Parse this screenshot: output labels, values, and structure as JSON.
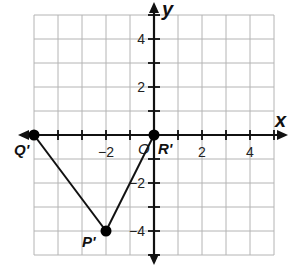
{
  "diagram": {
    "type": "coordinate-plane",
    "axes": {
      "x_label": "x",
      "y_label": "y",
      "origin_label": "O",
      "x_range": [
        -5,
        5
      ],
      "y_range": [
        -5,
        5
      ],
      "grid_step": 1,
      "x_tick_labels": [
        {
          "value": -2,
          "text": "−2"
        },
        {
          "value": 2,
          "text": "2"
        },
        {
          "value": 4,
          "text": "4"
        }
      ],
      "y_tick_labels": [
        {
          "value": 4,
          "text": "4"
        },
        {
          "value": 2,
          "text": "2"
        },
        {
          "value": -2,
          "text": "−2"
        },
        {
          "value": -4,
          "text": "−4"
        }
      ]
    },
    "points": [
      {
        "name": "Q'",
        "x": -5,
        "y": 0
      },
      {
        "name": "P'",
        "x": -2,
        "y": -4
      },
      {
        "name": "R'",
        "x": 0,
        "y": 0
      }
    ],
    "segments": [
      [
        "Q'",
        "P'"
      ],
      [
        "P'",
        "R'"
      ]
    ],
    "colors": {
      "grid": "#b4b4b4",
      "axis": "#111111",
      "point": "#000000"
    }
  }
}
